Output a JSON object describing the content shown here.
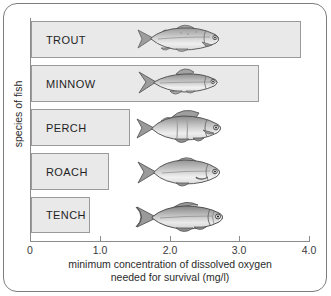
{
  "chart_data": {
    "type": "bar",
    "orientation": "horizontal",
    "title": "",
    "xlabel_line1": "minimum concentration of dissolved oxygen",
    "xlabel_line2": "needed for survival (mg/l)",
    "ylabel": "species of fish",
    "categories": [
      "TROUT",
      "MINNOW",
      "PERCH",
      "ROACH",
      "TENCH"
    ],
    "values": [
      3.85,
      3.25,
      1.4,
      1.1,
      0.83
    ],
    "xlim": [
      0,
      4.0
    ],
    "xticks": [
      "0",
      "1.0",
      "2.0",
      "3.0",
      "4.0"
    ],
    "xtick_values": [
      0,
      1.0,
      2.0,
      3.0,
      4.0
    ],
    "grid": false,
    "legend": "none",
    "bar_fill": "#e9e9e9",
    "bar_border": "#9a9a9a"
  },
  "bars": [
    {
      "name": "TROUT",
      "label": "TROUT",
      "value": 3.85
    },
    {
      "name": "MINNOW",
      "label": "MINNOW",
      "value": 3.25
    },
    {
      "name": "PERCH",
      "label": "PERCH",
      "value": 1.4
    },
    {
      "name": "ROACH",
      "label": "ROACH",
      "value": 1.1
    },
    {
      "name": "TENCH",
      "label": "TENCH",
      "value": 0.83
    }
  ],
  "ticks": [
    {
      "label": "0"
    },
    {
      "label": "1.0"
    },
    {
      "label": "2.0"
    },
    {
      "label": "3.0"
    },
    {
      "label": "4.0"
    }
  ],
  "fish_illustrations": [
    {
      "species": "trout-illustration"
    },
    {
      "species": "minnow-illustration"
    },
    {
      "species": "perch-illustration"
    },
    {
      "species": "roach-illustration"
    },
    {
      "species": "tench-illustration"
    }
  ]
}
